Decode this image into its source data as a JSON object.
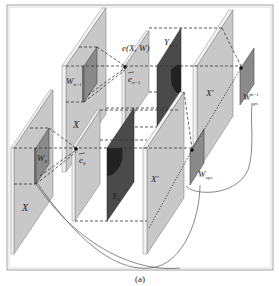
{
  "figure": {
    "caption": "(a)",
    "colors": {
      "plane_fill": "#c8c8c8",
      "plane_edge": "#f2f2f2",
      "plane_side": "#9a9a9a",
      "dark_plane": "#4a4a4a",
      "darker_blob": "#262626",
      "kernel_fill": "#8a8a8a",
      "line": "#333333",
      "frame": "#888888"
    },
    "labels": {
      "x_front": "X",
      "x_back": "X",
      "w0": "W",
      "w0_sub": "0",
      "wn1": "W",
      "wn1_sub": "n−1",
      "e0": "e",
      "e0_sub": "0",
      "en1": "e",
      "en1_sub": "n−1",
      "exw": "e(X, W)",
      "y0": "Y",
      "y0_sub": "0",
      "yn1": "Y",
      "yn1_sub": "n−1",
      "xprime_front": "X′",
      "xprime_back": "X′",
      "wops": "W",
      "wops_sub": "ops",
      "wops_n1": "W",
      "wops_n1_sup": "n−1",
      "wops_n1_sub": "ops"
    }
  }
}
